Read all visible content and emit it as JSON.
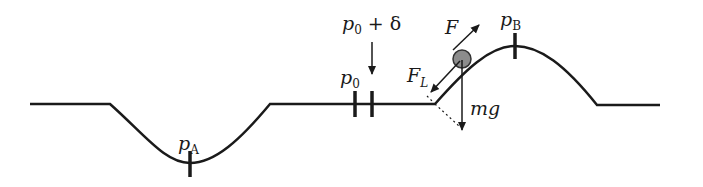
{
  "diagram": {
    "labels": {
      "p_a": {
        "main": "p",
        "sub": "A"
      },
      "p_b": {
        "main": "p",
        "sub": "B"
      },
      "p_0": {
        "main": "p",
        "sub": "0"
      },
      "p_0_delta": {
        "main": "p",
        "sub": "0",
        "rest": " + δ"
      },
      "force_f": "F",
      "force_fl": {
        "main": "F",
        "sub": "L"
      },
      "gravity": "mg"
    },
    "colors": {
      "line": "#1a1a1a",
      "ball_fill": "#8c8c8c"
    }
  }
}
